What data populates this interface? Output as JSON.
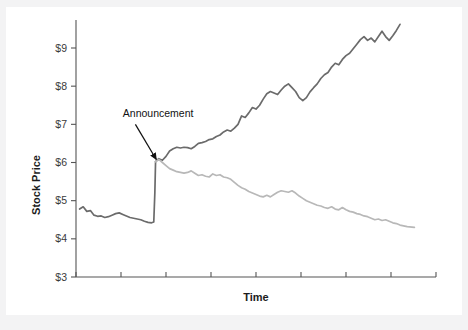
{
  "figure": {
    "background_color": "#f3f3f4",
    "page_color": "#ffffff",
    "axis_color": "#555555"
  },
  "chart_data": {
    "type": "line",
    "title": "",
    "subtitle": "",
    "xlabel": "Time",
    "ylabel": "Stock Price",
    "grid": false,
    "legend_position": "none",
    "ylim": [
      3,
      9.8
    ],
    "ytick_labels": [
      "$3",
      "$4",
      "$5",
      "$6",
      "$7",
      "$8",
      "$9"
    ],
    "ytick_values": [
      3,
      4,
      5,
      6,
      7,
      8,
      9
    ],
    "xlim": [
      0,
      100
    ],
    "xtick_values": [
      0,
      12.5,
      25,
      37.5,
      50,
      62.5,
      75,
      87.5,
      100
    ],
    "xtick_labels": [
      "",
      "",
      "",
      "",
      "",
      "",
      "",
      "",
      ""
    ],
    "annotations": [
      {
        "text": "Announcement",
        "text_x": 13,
        "text_y": 7.2,
        "arrow_from_x": 16.5,
        "arrow_from_y": 7.0,
        "arrow_to_x": 22.3,
        "arrow_to_y": 6.08,
        "color": "#111111"
      }
    ],
    "series": [
      {
        "name": "Pre-announcement price",
        "color": "#6b6b6b",
        "width": 1.7,
        "x": [
          1.0,
          2.0,
          3.0,
          4.0,
          5.0,
          6.0,
          7.0,
          8.0,
          9.0,
          10.0,
          11.0,
          12.0,
          13.0,
          14.0,
          15.0,
          16.0,
          17.0,
          18.0,
          19.0,
          20.0,
          21.0,
          21.6,
          21.9,
          22.1
        ],
        "values": [
          4.78,
          4.84,
          4.72,
          4.74,
          4.62,
          4.59,
          4.6,
          4.56,
          4.58,
          4.62,
          4.66,
          4.68,
          4.64,
          4.6,
          4.56,
          4.54,
          4.52,
          4.5,
          4.46,
          4.43,
          4.42,
          4.44,
          5.2,
          6.02
        ]
      },
      {
        "name": "Good-news path",
        "color": "#6b6b6b",
        "width": 1.7,
        "x": [
          22.1,
          23.0,
          24.0,
          25.0,
          26.0,
          27.0,
          28.0,
          29.0,
          30.0,
          31.0,
          32.0,
          33.0,
          34.0,
          35.0,
          36.0,
          37.0,
          38.0,
          39.0,
          40.0,
          41.0,
          42.0,
          43.0,
          44.0,
          45.0,
          46.0,
          47.0,
          48.0,
          49.0,
          50.0,
          51.0,
          52.0,
          53.0,
          54.0,
          55.0,
          56.0,
          57.0,
          58.0,
          59.0,
          60.0,
          61.0,
          62.0,
          63.0,
          64.0,
          65.0,
          66.0,
          67.0,
          68.0,
          69.0,
          70.0,
          71.0,
          72.0,
          73.0,
          74.0,
          75.0,
          76.0,
          77.0,
          78.0,
          79.0,
          80.0,
          81.0,
          82.0,
          83.0,
          84.0,
          85.0,
          86.0,
          87.0,
          88.0,
          89.0,
          90.0
        ],
        "values": [
          6.02,
          6.1,
          6.06,
          6.16,
          6.3,
          6.36,
          6.4,
          6.38,
          6.4,
          6.39,
          6.36,
          6.42,
          6.5,
          6.52,
          6.55,
          6.6,
          6.62,
          6.68,
          6.72,
          6.8,
          6.85,
          6.82,
          6.9,
          7.0,
          7.22,
          7.18,
          7.3,
          7.44,
          7.4,
          7.5,
          7.66,
          7.8,
          7.86,
          7.82,
          7.78,
          7.9,
          8.0,
          8.06,
          7.96,
          7.86,
          7.7,
          7.62,
          7.7,
          7.85,
          7.96,
          8.06,
          8.2,
          8.3,
          8.36,
          8.5,
          8.6,
          8.56,
          8.7,
          8.8,
          8.86,
          8.98,
          9.1,
          9.22,
          9.3,
          9.2,
          9.26,
          9.16,
          9.3,
          9.44,
          9.3,
          9.2,
          9.32,
          9.46,
          9.62
        ]
      },
      {
        "name": "Bad-news path",
        "color": "#b8b8b8",
        "width": 1.7,
        "x": [
          22.1,
          23.0,
          24.0,
          25.0,
          26.0,
          27.0,
          28.0,
          29.0,
          30.0,
          31.0,
          32.0,
          33.0,
          34.0,
          35.0,
          36.0,
          37.0,
          38.0,
          39.0,
          40.0,
          41.0,
          42.0,
          43.0,
          44.0,
          45.0,
          46.0,
          47.0,
          48.0,
          49.0,
          50.0,
          51.0,
          52.0,
          53.0,
          54.0,
          55.0,
          56.0,
          57.0,
          58.0,
          59.0,
          60.0,
          61.0,
          62.0,
          63.0,
          64.0,
          65.0,
          66.0,
          67.0,
          68.0,
          69.0,
          70.0,
          71.0,
          72.0,
          73.0,
          74.0,
          75.0,
          76.0,
          77.0,
          78.0,
          79.0,
          80.0,
          81.0,
          82.0,
          83.0,
          84.0,
          85.0,
          86.0,
          87.0,
          88.0,
          89.0,
          90.0,
          92.0,
          94.0
        ],
        "values": [
          6.02,
          6.08,
          6.0,
          5.92,
          5.84,
          5.8,
          5.76,
          5.74,
          5.72,
          5.74,
          5.78,
          5.72,
          5.66,
          5.68,
          5.64,
          5.62,
          5.7,
          5.66,
          5.68,
          5.62,
          5.6,
          5.56,
          5.48,
          5.4,
          5.34,
          5.3,
          5.24,
          5.2,
          5.16,
          5.12,
          5.1,
          5.14,
          5.1,
          5.16,
          5.22,
          5.26,
          5.24,
          5.22,
          5.26,
          5.2,
          5.12,
          5.06,
          5.0,
          4.96,
          4.92,
          4.88,
          4.86,
          4.82,
          4.8,
          4.84,
          4.78,
          4.76,
          4.82,
          4.76,
          4.72,
          4.7,
          4.66,
          4.64,
          4.6,
          4.58,
          4.54,
          4.5,
          4.52,
          4.48,
          4.5,
          4.46,
          4.42,
          4.4,
          4.36,
          4.32,
          4.3
        ]
      }
    ]
  }
}
